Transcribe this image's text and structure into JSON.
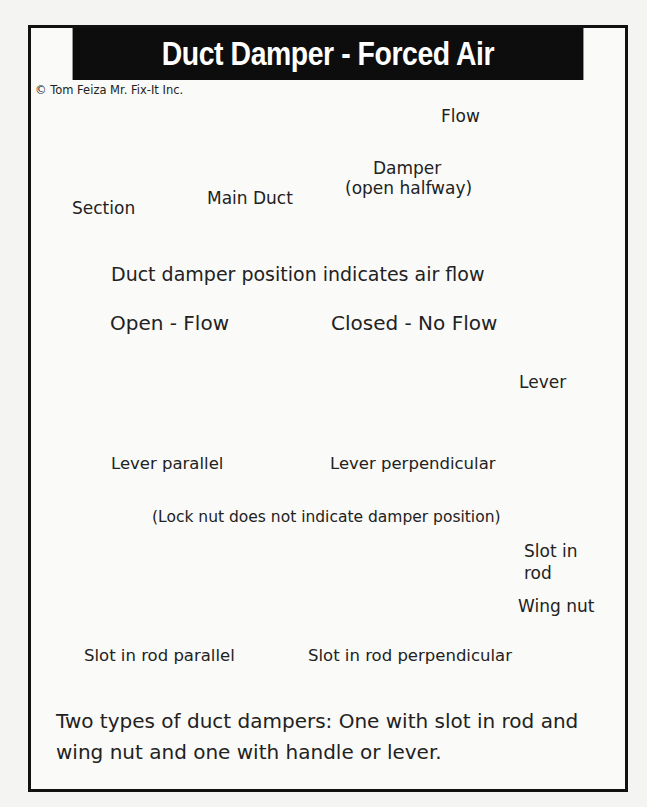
{
  "title": "Duct Damper - Forced Air",
  "copyright": "© Tom Feiza Mr. Fix-It Inc.",
  "top_diagram": {
    "main_duct_label": "Main Duct",
    "section_label": "Section",
    "flow_label": "Flow",
    "damper_label": "Damper",
    "damper_sublabel": "(open halfway)"
  },
  "subtitle": "Duct damper position indicates air flow",
  "panel": {
    "open_heading": "Open - Flow",
    "closed_heading": "Closed - No Flow",
    "lever_label": "Lever",
    "lever_parallel_caption": "Lever parallel",
    "lever_perpendicular_caption": "Lever perpendicular",
    "lock_nut_note": "(Lock nut does not indicate damper position)",
    "slot_in_rod_label_line1": "Slot in",
    "slot_in_rod_label_line2": "rod",
    "wing_nut_label": "Wing nut",
    "slot_parallel_caption": "Slot in rod parallel",
    "slot_perpendicular_caption": "Slot in rod perpendicular"
  },
  "footer_text": "Two types of duct dampers:  One with slot in rod and wing nut and one with handle or lever.",
  "colors": {
    "title_bar": "#0d0d0d",
    "ink": "#1a1a1a",
    "paper": "#fafaf8",
    "lever_fill": "#3a3a3a"
  }
}
